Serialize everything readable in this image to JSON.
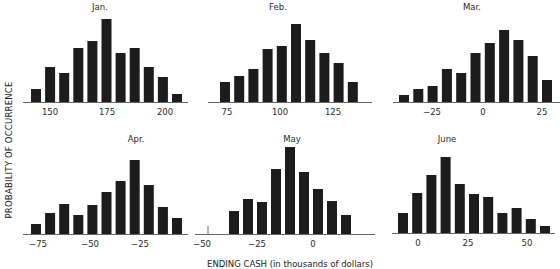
{
  "figure": {
    "ylabel": "PROBABILITY OF OCCURRENCE",
    "xlabel": "ENDING CASH (in thousands of dollars)",
    "bar_color": "#1c1c1c",
    "axis_color": "#555555"
  },
  "chart_data": [
    {
      "type": "bar",
      "title": "Jan.",
      "xlabel": "ENDING CASH (in thousands of dollars)",
      "ylabel": "PROBABILITY OF OCCURRENCE",
      "tick_labels": [
        "150",
        "175",
        "200"
      ],
      "tick_values": [
        150,
        175,
        200
      ],
      "bin_centers": [
        145,
        150,
        155,
        160,
        165,
        170,
        175,
        180,
        185,
        190,
        195,
        200,
        205
      ],
      "values": [
        13,
        35,
        29,
        54,
        61,
        83,
        49,
        54,
        35,
        25,
        8
      ],
      "grid": false,
      "layout": {
        "x0": 23,
        "x1": 188,
        "baseline": 102,
        "bar_left": 31,
        "bar_step": 14.1,
        "bar_width": 10,
        "title_x": 100,
        "title_y": 10,
        "ticks_x": [
          50,
          107,
          165
        ],
        "tick_y": 115
      }
    },
    {
      "type": "bar",
      "title": "Feb.",
      "xlabel": "ENDING CASH (in thousands of dollars)",
      "ylabel": "PROBABILITY OF OCCURRENCE",
      "tick_labels": [
        "75",
        "100",
        "125"
      ],
      "tick_values": [
        75,
        100,
        125
      ],
      "values": [
        20,
        26,
        33,
        53,
        56,
        78,
        62,
        49,
        39,
        20
      ],
      "grid": false,
      "layout": {
        "x0": 208,
        "x1": 372,
        "baseline": 102,
        "bar_left": 220,
        "bar_step": 14.2,
        "bar_width": 10,
        "title_x": 278,
        "title_y": 10,
        "ticks_x": [
          227,
          280,
          333
        ],
        "tick_y": 115
      }
    },
    {
      "type": "bar",
      "title": "Mar.",
      "xlabel": "ENDING CASH (in thousands of dollars)",
      "ylabel": "PROBABILITY OF OCCURRENCE",
      "tick_labels": [
        "−25",
        "0",
        "25"
      ],
      "tick_values": [
        -25,
        0,
        25
      ],
      "values": [
        7,
        13,
        16,
        33,
        29,
        49,
        59,
        72,
        62,
        46,
        22
      ],
      "grid": false,
      "layout": {
        "x0": 393,
        "x1": 560,
        "baseline": 102,
        "bar_left": 399,
        "bar_step": 14.3,
        "bar_width": 10,
        "title_x": 472,
        "title_y": 10,
        "ticks_x": [
          432,
          483,
          542
        ],
        "tick_y": 115
      }
    },
    {
      "type": "bar",
      "title": "Apr.",
      "xlabel": "ENDING CASH (in thousands of dollars)",
      "ylabel": "PROBABILITY OF OCCURRENCE",
      "tick_labels": [
        "−75",
        "−50",
        "−25"
      ],
      "tick_values": [
        -75,
        -50,
        -25
      ],
      "values": [
        10,
        21,
        30,
        19,
        29,
        42,
        53,
        74,
        49,
        27,
        16
      ],
      "grid": false,
      "layout": {
        "x0": 23,
        "x1": 188,
        "baseline": 234,
        "bar_left": 31,
        "bar_step": 14.1,
        "bar_width": 10,
        "title_x": 136,
        "title_y": 142,
        "ticks_x": [
          38,
          90,
          140
        ],
        "tick_y": 247
      }
    },
    {
      "type": "bar",
      "title": "May",
      "xlabel": "ENDING CASH (in thousands of dollars)",
      "ylabel": "PROBABILITY OF OCCURRENCE",
      "tick_labels": [
        "−50",
        "−25",
        "0"
      ],
      "tick_values": [
        -50,
        -25,
        0
      ],
      "values": [
        23,
        35,
        32,
        65,
        87,
        62,
        45,
        33,
        19
      ],
      "grid": false,
      "layout": {
        "x0": 195,
        "x1": 375,
        "baseline": 234,
        "bar_left": 229,
        "bar_step": 14.0,
        "bar_width": 10,
        "title_x": 292,
        "title_y": 142,
        "ticks_x": [
          202,
          257,
          313
        ],
        "tick_y": 247,
        "y_tick_x": 208
      }
    },
    {
      "type": "bar",
      "title": "June",
      "xlabel": "ENDING CASH (in thousands of dollars)",
      "ylabel": "PROBABILITY OF OCCURRENCE",
      "tick_labels": [
        "0",
        "25",
        "50"
      ],
      "tick_values": [
        0,
        25,
        50
      ],
      "values": [
        20,
        40,
        58,
        76,
        49,
        39,
        36,
        20,
        25,
        14,
        7
      ],
      "grid": false,
      "layout": {
        "x0": 392,
        "x1": 555,
        "baseline": 233,
        "bar_left": 398,
        "bar_step": 14.2,
        "bar_width": 10,
        "title_x": 447,
        "title_y": 142,
        "ticks_x": [
          418,
          468,
          527
        ],
        "tick_y": 246
      }
    }
  ]
}
